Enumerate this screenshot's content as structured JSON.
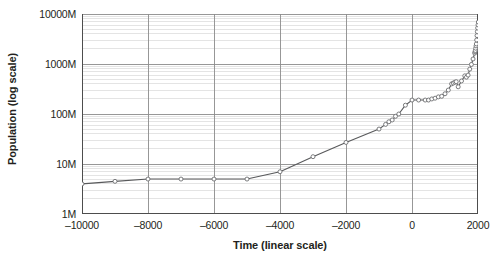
{
  "chart_data": {
    "type": "line",
    "title": "",
    "xlabel": "Time (linear scale)",
    "ylabel": "Population (log scale)",
    "xlim": [
      -10000,
      2000
    ],
    "ylim": [
      1,
      10000
    ],
    "yscale": "log",
    "xscale": "linear",
    "grid": true,
    "minor_grid": true,
    "legend": "none",
    "y_unit": "M",
    "xticks": [
      -10000,
      -8000,
      -6000,
      -4000,
      -2000,
      0,
      2000
    ],
    "xtick_labels": [
      "–10000",
      "–8000",
      "–6000",
      "–4000",
      "–2000",
      "0",
      "2000"
    ],
    "yticks": [
      1,
      10,
      100,
      1000,
      10000
    ],
    "ytick_labels": [
      "1M",
      "10M",
      "100M",
      "1000M",
      "10000M"
    ],
    "marker": "open-circle",
    "line_color": "#58595b",
    "marker_color": "#6d6e71",
    "series": [
      {
        "name": "World population",
        "x": [
          -10000,
          -9000,
          -8000,
          -7000,
          -6000,
          -5000,
          -4000,
          -3000,
          -2000,
          -1000,
          -800,
          -700,
          -600,
          -500,
          -400,
          -200,
          1,
          200,
          400,
          500,
          600,
          700,
          800,
          900,
          1000,
          1100,
          1200,
          1250,
          1300,
          1340,
          1400,
          1500,
          1600,
          1650,
          1700,
          1750,
          1800,
          1850,
          1900,
          1910,
          1920,
          1930,
          1940,
          1950,
          1960,
          1970,
          1980,
          1990,
          2000,
          2010
        ],
        "y": [
          4,
          4.5,
          5,
          5,
          5,
          5,
          7,
          14,
          27,
          50,
          62,
          70,
          76,
          90,
          100,
          150,
          190,
          190,
          190,
          190,
          200,
          207,
          220,
          226,
          254,
          301,
          400,
          416,
          432,
          443,
          350,
          458,
          580,
          545,
          600,
          790,
          980,
          1260,
          1650,
          1750,
          1860,
          2070,
          2300,
          2520,
          3020,
          3700,
          4440,
          5270,
          6060,
          6900
        ]
      }
    ]
  }
}
